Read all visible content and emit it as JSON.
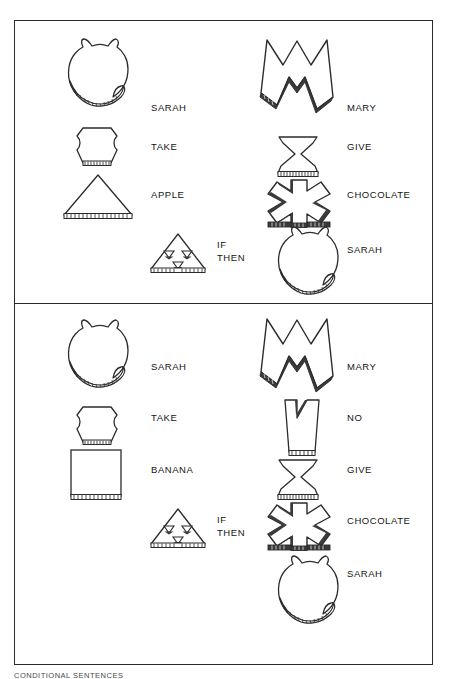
{
  "figure": {
    "caption": "CONDITIONAL SENTENCES",
    "panels": [
      {
        "id": "panel-top",
        "name": "panel-sarah-take-apple",
        "left_column": [
          {
            "symbol": "sarah-cat-shape",
            "label": "SARAH"
          },
          {
            "symbol": "take-hourglass-lobed-shape",
            "label": "TAKE"
          },
          {
            "symbol": "apple-triangle-shape",
            "label": "APPLE"
          }
        ],
        "conditional": {
          "symbol": "if-then-triangle-shape",
          "label_line1": "IF",
          "label_line2": "THEN"
        },
        "right_column": [
          {
            "symbol": "mary-m-shape",
            "label": "MARY"
          },
          {
            "symbol": "give-bowtie-shape",
            "label": "GIVE"
          },
          {
            "symbol": "chocolate-asterisk-shape",
            "label": "CHOCOLATE"
          },
          {
            "symbol": "sarah-cat-shape",
            "label": "SARAH"
          }
        ]
      },
      {
        "id": "panel-bottom",
        "name": "panel-sarah-take-banana",
        "left_column": [
          {
            "symbol": "sarah-cat-shape",
            "label": "SARAH"
          },
          {
            "symbol": "take-hourglass-lobed-shape",
            "label": "TAKE"
          },
          {
            "symbol": "banana-square-shape",
            "label": "BANANA"
          }
        ],
        "conditional": {
          "symbol": "if-then-triangle-shape",
          "label_line1": "IF",
          "label_line2": "THEN"
        },
        "right_column": [
          {
            "symbol": "mary-m-shape",
            "label": "MARY"
          },
          {
            "symbol": "no-cup-shape",
            "label": "NO"
          },
          {
            "symbol": "give-bowtie-shape",
            "label": "GIVE"
          },
          {
            "symbol": "chocolate-asterisk-shape",
            "label": "CHOCOLATE"
          },
          {
            "symbol": "sarah-cat-shape",
            "label": "SARAH"
          }
        ]
      }
    ]
  },
  "colors": {
    "outline": "#2b2b2b",
    "fill": "#ffffff",
    "shadow": "#3a3a3a",
    "text": "#141414",
    "background": "#ffffff"
  }
}
